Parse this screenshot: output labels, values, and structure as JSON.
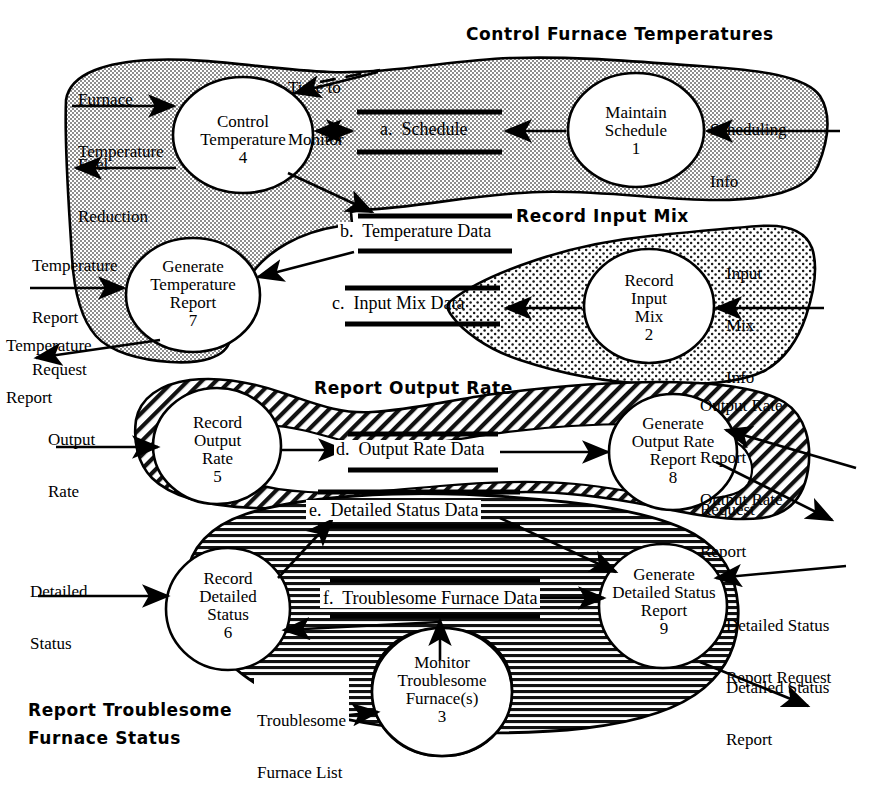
{
  "diagram": {
    "regions": [
      {
        "id": "control-furnace-temperatures",
        "label": "Control Furnace Temperatures",
        "fill": "grey-dots"
      },
      {
        "id": "record-input-mix",
        "label": "Record Input Mix",
        "fill": "sparse-dots"
      },
      {
        "id": "report-output-rate",
        "label": "Report Output Rate",
        "fill": "diagonal-hatch"
      },
      {
        "id": "report-troublesome-furnace-status",
        "label_line1": "Report Troublesome",
        "label_line2": "Furnace Status",
        "fill": "horizontal-hatch"
      }
    ],
    "processes": [
      {
        "id": "p1",
        "line1": "Maintain",
        "line2": "Schedule",
        "line3": "",
        "number": "1"
      },
      {
        "id": "p2",
        "line1": "Record",
        "line2": "Input",
        "line3": "Mix",
        "number": "2"
      },
      {
        "id": "p3",
        "line1": "Monitor",
        "line2": "Troublesome",
        "line3": "Furnace(s)",
        "number": "3"
      },
      {
        "id": "p4",
        "line1": "Control",
        "line2": "Temperature",
        "line3": "",
        "number": "4"
      },
      {
        "id": "p5",
        "line1": "Record",
        "line2": "Output",
        "line3": "Rate",
        "number": "5"
      },
      {
        "id": "p6",
        "line1": "Record",
        "line2": "Detailed",
        "line3": "Status",
        "number": "6"
      },
      {
        "id": "p7",
        "line1": "Generate",
        "line2": "Temperature",
        "line3": "Report",
        "number": "7"
      },
      {
        "id": "p8",
        "line1": "Generate",
        "line2": "Output Rate",
        "line3": "Report",
        "number": "8"
      },
      {
        "id": "p9",
        "line1": "Generate",
        "line2": "Detailed Status",
        "line3": "Report",
        "number": "9"
      }
    ],
    "stores": [
      {
        "id": "a",
        "label": "a.  Schedule"
      },
      {
        "id": "b",
        "label": "b.  Temperature Data"
      },
      {
        "id": "c",
        "label": "c.  Input Mix Data"
      },
      {
        "id": "d",
        "label": "d.  Output Rate Data"
      },
      {
        "id": "e",
        "label": "e.  Detailed Status Data"
      },
      {
        "id": "f",
        "label": "f.  Troublesome Furnace Data"
      }
    ],
    "flows": [
      {
        "id": "time-to-monitor",
        "line1": "Time to",
        "line2": "Monitor",
        "line3": ""
      },
      {
        "id": "furnace-temperature",
        "line1": "Furnace",
        "line2": "Temperature",
        "line3": ""
      },
      {
        "id": "fuel-reduction",
        "line1": "Fuel",
        "line2": "Reduction",
        "line3": ""
      },
      {
        "id": "scheduling-info",
        "line1": "Scheduling",
        "line2": "Info",
        "line3": ""
      },
      {
        "id": "temperature-report-request",
        "line1": "Temperature",
        "line2": "Report",
        "line3": "Request"
      },
      {
        "id": "temperature-report",
        "line1": "Temperature",
        "line2": "Report",
        "line3": ""
      },
      {
        "id": "input-mix-info",
        "line1": "Input",
        "line2": "Mix",
        "line3": "Info"
      },
      {
        "id": "output-rate",
        "line1": "Output",
        "line2": "Rate",
        "line3": ""
      },
      {
        "id": "output-rate-report-request",
        "line1": "Output Rate",
        "line2": "Report",
        "line3": "Request"
      },
      {
        "id": "output-rate-report",
        "line1": "Output Rate",
        "line2": "Report",
        "line3": ""
      },
      {
        "id": "detailed-status",
        "line1": "Detailed",
        "line2": "Status",
        "line3": ""
      },
      {
        "id": "detailed-status-report-request",
        "line1": "Detailed Status",
        "line2": "Report Request",
        "line3": ""
      },
      {
        "id": "detailed-status-report",
        "line1": "Detailed Status",
        "line2": "Report",
        "line3": ""
      },
      {
        "id": "troublesome-furnace-list",
        "line1": "Troublesome",
        "line2": "Furnace List",
        "line3": ""
      }
    ]
  }
}
